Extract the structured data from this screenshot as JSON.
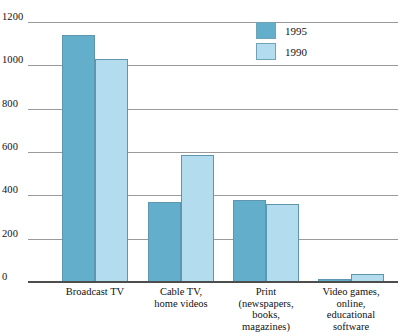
{
  "chart_data": {
    "type": "bar",
    "title": "",
    "subtitle": "",
    "xlabel": "",
    "ylabel": "",
    "grid": true,
    "legend_position": "top-right",
    "ylim": [
      0,
      1200
    ],
    "yticks": [
      0,
      200,
      400,
      600,
      800,
      1000,
      1200
    ],
    "ytick_labels": [
      "0",
      "200",
      "400",
      "600",
      "800",
      "1000",
      "1200"
    ],
    "categories": [
      "Broadcast TV",
      "Cable TV,\nhome videos",
      "Print\n(newspapers,\nbooks,\nmagazines)",
      "Video games,\nonline,\neducational\nsoftware"
    ],
    "series": [
      {
        "name": "1995",
        "color": "#62aecb",
        "values": [
          1140,
          370,
          378,
          12
        ]
      },
      {
        "name": "1990",
        "color": "#b3dcef",
        "values": [
          1030,
          585,
          362,
          35
        ]
      }
    ]
  },
  "legend": {
    "items": [
      {
        "label": "1995",
        "color": "#62aecb"
      },
      {
        "label": "1990",
        "color": "#b3dcef"
      }
    ]
  },
  "category_labels": [
    {
      "lines": [
        "Broadcast TV"
      ]
    },
    {
      "lines": [
        "Cable TV,",
        "home videos"
      ]
    },
    {
      "lines": [
        "Print",
        "(newspapers,",
        "books,",
        "magazines)"
      ]
    },
    {
      "lines": [
        "Video games,",
        "online,",
        "educational",
        "software"
      ]
    }
  ],
  "colors": {
    "series_1995": "#62aecb",
    "series_1990": "#b3dcef",
    "gridline": "#9a9a9a",
    "axis": "#4d4d4d",
    "text": "#111111",
    "background": "#ffffff"
  }
}
